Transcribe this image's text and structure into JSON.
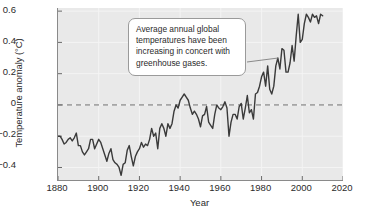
{
  "chart_data": {
    "type": "line",
    "title": "",
    "xlabel": "Year",
    "ylabel": "Temperature anomaly (°C)",
    "xlim": [
      1880,
      2020
    ],
    "ylim": [
      -0.48,
      0.62
    ],
    "xticks": [
      1880,
      1900,
      1920,
      1940,
      1960,
      1980,
      2000,
      2020
    ],
    "xtick_labels": [
      "1880",
      "1900",
      "1920",
      "1940",
      "1960",
      "1980",
      "2000",
      "2020"
    ],
    "yticks": [
      0.6,
      0.4,
      0.2,
      0,
      -0.2,
      -0.4
    ],
    "ytick_labels": [
      "0.6",
      "0.4",
      "0.2",
      "0",
      "−0.2",
      "−0.4"
    ],
    "grid": "light vertical gridlines at x ticks, horizontal gridlines at y ticks",
    "legend": "none",
    "reference_line": {
      "y": 0,
      "style": "dashed",
      "color": "#6e6e6e"
    },
    "line_color": "#3a3a3a",
    "plot_background": "#e9e9e9",
    "series": [
      {
        "name": "Global average annual temperature anomaly",
        "units": "°C",
        "x": [
          1880,
          1881,
          1882,
          1883,
          1884,
          1885,
          1886,
          1887,
          1888,
          1889,
          1890,
          1891,
          1892,
          1893,
          1894,
          1895,
          1896,
          1897,
          1898,
          1899,
          1900,
          1901,
          1902,
          1903,
          1904,
          1905,
          1906,
          1907,
          1908,
          1909,
          1910,
          1911,
          1912,
          1913,
          1914,
          1915,
          1916,
          1917,
          1918,
          1919,
          1920,
          1921,
          1922,
          1923,
          1924,
          1925,
          1926,
          1927,
          1928,
          1929,
          1930,
          1931,
          1932,
          1933,
          1934,
          1935,
          1936,
          1937,
          1938,
          1939,
          1940,
          1941,
          1942,
          1943,
          1944,
          1945,
          1946,
          1947,
          1948,
          1949,
          1950,
          1951,
          1952,
          1953,
          1954,
          1955,
          1956,
          1957,
          1958,
          1959,
          1960,
          1961,
          1962,
          1963,
          1964,
          1965,
          1966,
          1967,
          1968,
          1969,
          1970,
          1971,
          1972,
          1973,
          1974,
          1975,
          1976,
          1977,
          1978,
          1979,
          1980,
          1981,
          1982,
          1983,
          1984,
          1985,
          1986,
          1987,
          1988,
          1989,
          1990,
          1991,
          1992,
          1993,
          1994,
          1995,
          1996,
          1997,
          1998,
          1999,
          2000,
          2001,
          2002,
          2003,
          2004,
          2005,
          2006,
          2007,
          2008,
          2009,
          2010
        ],
        "values": [
          -0.2,
          -0.2,
          -0.22,
          -0.25,
          -0.24,
          -0.22,
          -0.21,
          -0.23,
          -0.21,
          -0.18,
          -0.26,
          -0.26,
          -0.3,
          -0.32,
          -0.3,
          -0.28,
          -0.22,
          -0.22,
          -0.28,
          -0.25,
          -0.22,
          -0.24,
          -0.28,
          -0.32,
          -0.36,
          -0.31,
          -0.28,
          -0.35,
          -0.37,
          -0.38,
          -0.4,
          -0.45,
          -0.38,
          -0.37,
          -0.29,
          -0.26,
          -0.33,
          -0.39,
          -0.33,
          -0.3,
          -0.28,
          -0.24,
          -0.27,
          -0.25,
          -0.26,
          -0.22,
          -0.15,
          -0.2,
          -0.18,
          -0.28,
          -0.15,
          -0.12,
          -0.15,
          -0.2,
          -0.12,
          -0.15,
          -0.12,
          -0.04,
          0.0,
          -0.02,
          0.03,
          0.05,
          0.07,
          0.05,
          0.03,
          -0.02,
          -0.06,
          -0.04,
          -0.06,
          -0.09,
          -0.14,
          -0.07,
          -0.06,
          -0.01,
          -0.11,
          -0.13,
          -0.15,
          -0.06,
          0.0,
          -0.02,
          -0.03,
          -0.01,
          0.02,
          -0.02,
          -0.2,
          -0.11,
          -0.06,
          -0.06,
          -0.09,
          -0.01,
          0.01,
          -0.09,
          -0.02,
          0.06,
          -0.05,
          -0.03,
          -0.09,
          0.07,
          0.08,
          0.12,
          0.18,
          0.21,
          0.12,
          0.25,
          0.1,
          0.07,
          0.12,
          0.25,
          0.3,
          0.23,
          0.36,
          0.35,
          0.21,
          0.21,
          0.27,
          0.38,
          0.28,
          0.44,
          0.58,
          0.4,
          0.42,
          0.52,
          0.58,
          0.56,
          0.53,
          0.58,
          0.56,
          0.57,
          0.52,
          0.58,
          0.57
        ],
        "notes": "Starts near −0.20 °C in 1880, minimum about −0.45 °C near 1910, a local peak just above 0 °C in the early 1940s, and a steep rise after about 1975 reaching roughly +0.58 °C by 2005–2010."
      }
    ],
    "annotations": [
      {
        "text": "Average annual global temperatures have been increasing in concert with greenhouse gases.",
        "style": "rounded white callout box with leader line",
        "points_to_year": 1988,
        "points_to_value": 0.3
      }
    ]
  },
  "callout": {
    "line1": "Average annual global",
    "line2": "temperatures have been",
    "line3": "increasing in concert with",
    "line4": "greenhouse gases."
  }
}
